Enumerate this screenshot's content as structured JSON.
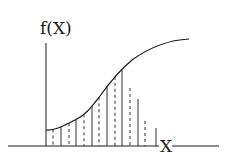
{
  "diagram": {
    "y_axis_label": "f(X)",
    "x_axis_label": "X",
    "stroke_color": "#1a1a1a",
    "background": "#ffffff",
    "curve_path": "M46,130 C55,131 65,125 75,120 C86,115 92,106 100,96 C110,82 120,70 132,60 C150,47 168,40 189,39",
    "ordinates": [
      {
        "x": 53,
        "style": "dashed"
      },
      {
        "x": 61,
        "style": "solid"
      },
      {
        "x": 69,
        "style": "dashed"
      },
      {
        "x": 76,
        "style": "solid"
      },
      {
        "x": 84,
        "style": "dashed"
      },
      {
        "x": 92,
        "style": "solid"
      },
      {
        "x": 99,
        "style": "dashed"
      },
      {
        "x": 107,
        "style": "solid"
      },
      {
        "x": 115,
        "style": "dashed"
      },
      {
        "x": 122,
        "style": "solid"
      },
      {
        "x": 130,
        "style": "dashed",
        "top": 88
      },
      {
        "x": 138,
        "style": "solid",
        "top": 99
      },
      {
        "x": 145,
        "style": "dashed",
        "top": 121
      },
      {
        "x": 156,
        "style": "solid",
        "top": 128
      }
    ]
  }
}
